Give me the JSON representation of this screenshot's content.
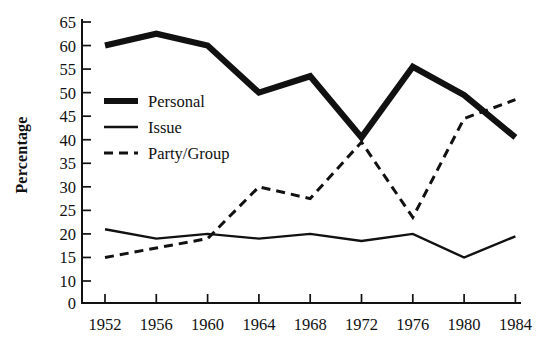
{
  "chart_data": {
    "type": "line",
    "title": "",
    "subtitle": "",
    "xlabel": "",
    "ylabel": "Percentage",
    "categories": [
      "1952",
      "1956",
      "1960",
      "1964",
      "1968",
      "1972",
      "1976",
      "1980",
      "1984"
    ],
    "x": [
      1952,
      1956,
      1960,
      1964,
      1968,
      1972,
      1976,
      1980,
      1984
    ],
    "series": [
      {
        "name": "Personal",
        "style": "thick-solid",
        "values": [
          60,
          62.5,
          60,
          50,
          53.5,
          40.5,
          55.5,
          49.5,
          40.5
        ]
      },
      {
        "name": "Issue",
        "style": "thin-solid",
        "values": [
          21,
          19,
          20,
          19,
          20,
          18.5,
          20,
          15,
          19.5
        ]
      },
      {
        "name": "Party/Group",
        "style": "dashed",
        "values": [
          15,
          17,
          19,
          30,
          27.5,
          39.5,
          23.5,
          44.5,
          48.5
        ]
      }
    ],
    "yticks": [
      0,
      10,
      15,
      20,
      25,
      30,
      35,
      40,
      45,
      50,
      55,
      60,
      65
    ],
    "ytick_labels": [
      "0",
      "10",
      "15",
      "20",
      "25",
      "30",
      "35",
      "40",
      "45",
      "50",
      "55",
      "60",
      "65"
    ],
    "ylim": [
      0,
      65
    ],
    "grid": false,
    "legend_position": "upper-left-inside",
    "line_color": "#111111",
    "background_color": "#ffffff"
  },
  "legend": {
    "entries": [
      {
        "label": "Personal"
      },
      {
        "label": "Issue"
      },
      {
        "label": "Party/Group"
      }
    ]
  },
  "axes": {
    "y_title": "Percentage"
  }
}
